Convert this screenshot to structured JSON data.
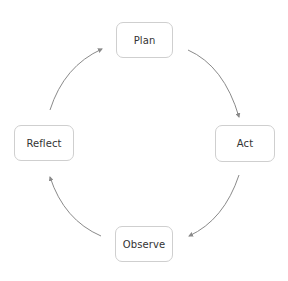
{
  "diagram": {
    "type": "cycle",
    "colors": {
      "node_border": "#cfcfcf",
      "node_text": "#333333",
      "arrow": "#8a8a8a",
      "background": "#ffffff"
    },
    "nodes": [
      {
        "id": "plan",
        "label": "Plan"
      },
      {
        "id": "act",
        "label": "Act"
      },
      {
        "id": "observe",
        "label": "Observe"
      },
      {
        "id": "reflect",
        "label": "Reflect"
      }
    ],
    "edges": [
      {
        "from": "plan",
        "to": "act"
      },
      {
        "from": "act",
        "to": "observe"
      },
      {
        "from": "observe",
        "to": "reflect"
      },
      {
        "from": "reflect",
        "to": "plan"
      }
    ]
  }
}
